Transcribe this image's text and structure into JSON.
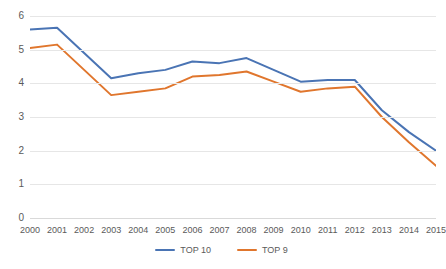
{
  "chart_data": {
    "type": "line",
    "title": "",
    "xlabel": "",
    "ylabel": "",
    "categories": [
      "2000",
      "2001",
      "2002",
      "2003",
      "2004",
      "2005",
      "2006",
      "2007",
      "2008",
      "2009",
      "2010",
      "2011",
      "2012",
      "2013",
      "2014",
      "2015"
    ],
    "x": [
      2000,
      2001,
      2002,
      2003,
      2004,
      2005,
      2006,
      2007,
      2008,
      2009,
      2010,
      2011,
      2012,
      2013,
      2014,
      2015
    ],
    "series": [
      {
        "name": "TOP 10",
        "color": "#4a74b4",
        "values": [
          5.6,
          5.65,
          4.9,
          4.15,
          4.3,
          4.4,
          4.65,
          4.6,
          4.75,
          4.4,
          4.05,
          4.1,
          4.1,
          3.2,
          2.55,
          2.0
        ]
      },
      {
        "name": "TOP 9",
        "color": "#e0762d",
        "values": [
          5.05,
          5.15,
          4.4,
          3.65,
          3.75,
          3.85,
          4.2,
          4.25,
          4.35,
          4.05,
          3.75,
          3.85,
          3.9,
          3.0,
          2.25,
          1.55
        ]
      }
    ],
    "ylim": [
      0,
      6
    ],
    "yticks": [
      0,
      1,
      2,
      3,
      4,
      5,
      6
    ],
    "ytick_labels": [
      "0",
      "1",
      "2",
      "3",
      "4",
      "5",
      "6"
    ],
    "grid": "horizontal",
    "legend_position": "bottom-center",
    "background": "#ffffff",
    "gridline_color": "#e6e6e6",
    "tick_label_color": "#5a5a5a"
  }
}
